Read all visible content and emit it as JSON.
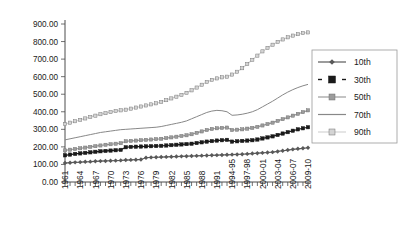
{
  "chart_data": {
    "type": "line",
    "title": "",
    "subtitle": "",
    "xlabel": "",
    "ylabel": "",
    "ylim": [
      0,
      900
    ],
    "yticks": [
      0,
      100,
      200,
      300,
      400,
      500,
      600,
      700,
      800,
      900
    ],
    "ytick_labels": [
      "0.00",
      "100.00",
      "200.00",
      "300.00",
      "400.00",
      "500.00",
      "600.00",
      "700.00",
      "800.00",
      "900.00"
    ],
    "grid": false,
    "legend_position": "right",
    "x": [
      "1961",
      "1962",
      "1963",
      "1964",
      "1965",
      "1966",
      "1967",
      "1968",
      "1969",
      "1970",
      "1971",
      "1972",
      "1973",
      "1974",
      "1975",
      "1976",
      "1977",
      "1978",
      "1979",
      "1980",
      "1981",
      "1982",
      "1983",
      "1984",
      "1985",
      "1986",
      "1987",
      "1988",
      "1989",
      "1990",
      "1991",
      "1992",
      "1993",
      "1994-95",
      "1995-96",
      "1996-97",
      "1997-98",
      "1998-99",
      "1999-2000",
      "2000-01",
      "2001-02",
      "2002-03",
      "2003-04",
      "2004-05",
      "2005-06",
      "2006-07",
      "2007-08",
      "2008-09",
      "2009-10"
    ],
    "xtick_labels": [
      "1961",
      "1964",
      "1967",
      "1970",
      "1973",
      "1976",
      "1979",
      "1982",
      "1985",
      "1988",
      "1991",
      "1994-95",
      "1997-98",
      "2000-01",
      "2003-04",
      "2006-07",
      "2009-10"
    ],
    "xtick_label_interval": 3,
    "series": [
      {
        "name": "10th",
        "color": "#595959",
        "marker": "diamond",
        "values": [
          108,
          110,
          112,
          113,
          115,
          116,
          118,
          119,
          120,
          121,
          122,
          123,
          125,
          126,
          127,
          128,
          138,
          140,
          141,
          142,
          143,
          144,
          145,
          146,
          147,
          148,
          149,
          150,
          151,
          152,
          153,
          154,
          155,
          156,
          157,
          158,
          160,
          162,
          164,
          166,
          168,
          170,
          174,
          178,
          182,
          186,
          189,
          192,
          195
        ]
      },
      {
        "name": "30th",
        "color": "#1a1a1a",
        "marker": "square",
        "values": [
          152,
          156,
          160,
          163,
          166,
          169,
          172,
          175,
          177,
          179,
          181,
          183,
          198,
          200,
          201,
          202,
          203,
          204,
          205,
          206,
          208,
          210,
          212,
          214,
          216,
          218,
          222,
          226,
          230,
          233,
          236,
          238,
          240,
          230,
          232,
          234,
          236,
          238,
          242,
          248,
          254,
          260,
          268,
          276,
          284,
          292,
          300,
          306,
          312
        ]
      },
      {
        "name": "50th",
        "color": "#9c9c9c",
        "marker": "square",
        "values": [
          180,
          184,
          188,
          192,
          196,
          200,
          204,
          208,
          212,
          215,
          218,
          221,
          232,
          234,
          236,
          238,
          240,
          242,
          244,
          246,
          250,
          254,
          258,
          262,
          266,
          272,
          280,
          288,
          296,
          302,
          306,
          308,
          310,
          296,
          298,
          300,
          304,
          308,
          314,
          322,
          330,
          338,
          348,
          358,
          368,
          378,
          388,
          398,
          408
        ]
      },
      {
        "name": "70th",
        "color": "#888888",
        "marker": "none",
        "values": [
          240,
          246,
          252,
          258,
          264,
          270,
          276,
          282,
          286,
          290,
          294,
          298,
          300,
          302,
          304,
          306,
          308,
          310,
          312,
          316,
          322,
          328,
          334,
          340,
          348,
          360,
          372,
          384,
          396,
          404,
          408,
          406,
          400,
          380,
          382,
          386,
          392,
          400,
          412,
          428,
          444,
          460,
          478,
          496,
          512,
          526,
          538,
          548,
          556
        ]
      },
      {
        "name": "90th",
        "color": "#d4d4d4",
        "marker": "square",
        "values": [
          330,
          338,
          346,
          354,
          362,
          370,
          378,
          386,
          392,
          398,
          404,
          408,
          412,
          418,
          424,
          430,
          436,
          442,
          448,
          456,
          466,
          476,
          486,
          496,
          508,
          522,
          538,
          554,
          570,
          582,
          590,
          596,
          600,
          612,
          628,
          648,
          672,
          696,
          720,
          744,
          764,
          782,
          798,
          812,
          824,
          834,
          842,
          848,
          852
        ]
      }
    ]
  },
  "legend": {
    "entries": [
      {
        "label": "10th"
      },
      {
        "label": "30th"
      },
      {
        "label": "50th"
      },
      {
        "label": "70th"
      },
      {
        "label": "90th"
      }
    ]
  }
}
